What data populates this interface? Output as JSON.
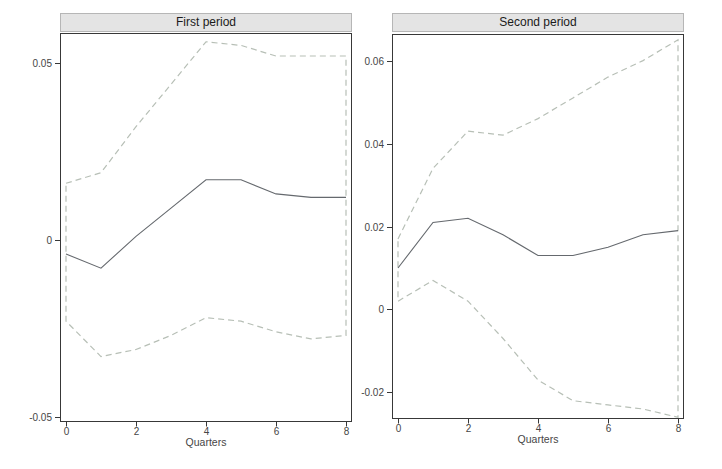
{
  "figure": {
    "background": "#ffffff",
    "colors": {
      "ci_line": "#b7bfb6",
      "center_line": "#65696e",
      "axis": "#383838",
      "tick_text": "#464646",
      "title_text": "#1b1b1b",
      "title_band_bg": "#e4e4e4",
      "title_band_border": "#b6b6b6"
    }
  },
  "chart_data": [
    {
      "type": "line",
      "title": "First period",
      "xlabel": "Quarters",
      "x": [
        0,
        1,
        2,
        3,
        4,
        5,
        6,
        7,
        8
      ],
      "xlim": [
        -0.17,
        8.17
      ],
      "ylim": [
        -0.0515,
        0.0585
      ],
      "x_tick_values": [
        0,
        2,
        4,
        6,
        8
      ],
      "x_tick_labels": [
        "0",
        "2",
        "4",
        "6",
        "8"
      ],
      "y_tick_values": [
        0.05,
        0,
        -0.05
      ],
      "y_tick_labels": [
        "0.05",
        "0",
        "-0.05"
      ],
      "grid": false,
      "legend": "none",
      "band_closed_at_ends": true,
      "series": [
        {
          "name": "upper-confidence-band",
          "style": "dashed",
          "values": [
            0.016,
            0.019,
            0.032,
            0.044,
            0.056,
            0.055,
            0.052,
            0.052,
            0.052
          ]
        },
        {
          "name": "impulse-response",
          "style": "solid",
          "values": [
            -0.004,
            -0.008,
            0.001,
            0.009,
            0.017,
            0.017,
            0.013,
            0.012,
            0.012
          ]
        },
        {
          "name": "lower-confidence-band",
          "style": "dashed",
          "values": [
            -0.023,
            -0.033,
            -0.031,
            -0.027,
            -0.022,
            -0.023,
            -0.026,
            -0.028,
            -0.027
          ]
        }
      ]
    },
    {
      "type": "line",
      "title": "Second period",
      "xlabel": "Quarters",
      "x": [
        0,
        1,
        2,
        3,
        4,
        5,
        6,
        7,
        8
      ],
      "xlim": [
        -0.17,
        8.17
      ],
      "ylim": [
        -0.0264,
        0.0664
      ],
      "x_tick_values": [
        0,
        2,
        4,
        6,
        8
      ],
      "x_tick_labels": [
        "0",
        "2",
        "4",
        "6",
        "8"
      ],
      "y_tick_values": [
        0.06,
        0.04,
        0.02,
        0,
        -0.02
      ],
      "y_tick_labels": [
        "0.06",
        "0.04",
        "0.02",
        "0",
        "-0.02"
      ],
      "grid": false,
      "legend": "none",
      "band_closed_at_ends": true,
      "series": [
        {
          "name": "upper-confidence-band",
          "style": "dashed",
          "values": [
            0.017,
            0.034,
            0.043,
            0.042,
            0.046,
            0.051,
            0.056,
            0.06,
            0.065
          ]
        },
        {
          "name": "impulse-response",
          "style": "solid",
          "values": [
            0.01,
            0.021,
            0.022,
            0.018,
            0.013,
            0.013,
            0.015,
            0.018,
            0.019
          ]
        },
        {
          "name": "lower-confidence-band",
          "style": "dashed",
          "values": [
            0.002,
            0.007,
            0.002,
            -0.007,
            -0.017,
            -0.022,
            -0.023,
            -0.024,
            -0.026
          ]
        }
      ]
    }
  ]
}
